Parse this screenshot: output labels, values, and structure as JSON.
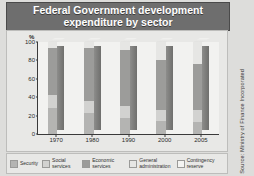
{
  "title": "Federal Government development expenditure by sector",
  "source": "Source: Ministry of Finance Incorporated",
  "axis": {
    "y_unit": "%",
    "y_ticks": [
      "100",
      "80",
      "60",
      "40",
      "20",
      "0"
    ]
  },
  "legend": {
    "items": [
      {
        "label": "Security",
        "color": "#b4b4b2"
      },
      {
        "label": "Social services",
        "color": "#d2d2d0"
      },
      {
        "label": "Economic services",
        "color": "#9c9c9a"
      },
      {
        "label": "General administration",
        "color": "#e6e6e4"
      },
      {
        "label": "Contingency reserve",
        "color": "#f4f4f2"
      }
    ]
  },
  "chart_data": {
    "type": "bar",
    "stacked": true,
    "normalized": true,
    "title": "Federal Government development expenditure by sector",
    "xlabel": "",
    "ylabel": "%",
    "ylim": [
      0,
      100
    ],
    "grid": false,
    "legend_position": "bottom",
    "categories": [
      "1970",
      "1980",
      "1990",
      "2000",
      "2005"
    ],
    "series": [
      {
        "name": "Security",
        "color": "#b4b4b2",
        "values": [
          28,
          23,
          17,
          14,
          13
        ]
      },
      {
        "name": "Social services",
        "color": "#d2d2d0",
        "values": [
          14,
          13,
          14,
          12,
          13
        ]
      },
      {
        "name": "Economic services",
        "color": "#9c9c9a",
        "values": [
          52,
          57,
          60,
          55,
          50
        ]
      },
      {
        "name": "General administration",
        "color": "#e6e6e4",
        "values": [
          6,
          7,
          9,
          19,
          24
        ]
      },
      {
        "name": "Contingency reserve",
        "color": "#f4f4f2",
        "values": [
          0,
          0,
          0,
          0,
          0
        ]
      }
    ]
  }
}
